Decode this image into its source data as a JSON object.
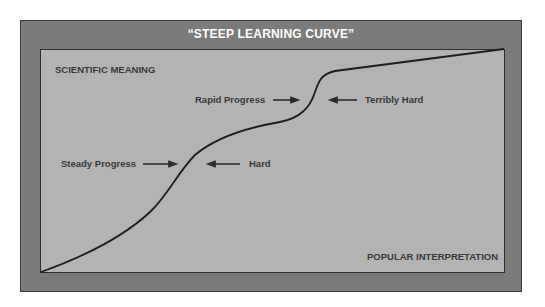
{
  "diagram": {
    "title": "“STEEP LEARNING CURVE”",
    "top_left_label": "SCIENTIFIC MEANING",
    "bottom_right_label": "POPULAR INTERPRETATION",
    "annotations": [
      {
        "text": "Steady Progress",
        "arrow": "right"
      },
      {
        "text": "Hard",
        "arrow": "left"
      },
      {
        "text": "Rapid Progress",
        "arrow": "right"
      },
      {
        "text": "Terribly Hard",
        "arrow": "left"
      }
    ],
    "colors": {
      "outer_frame": "#7b7b7b",
      "inner_panel": "#b3b3b3",
      "curve": "#1e1e1e",
      "label_text": "#3a3a3a",
      "title_text": "#ffffff"
    },
    "curve_shape": "s-curve rising with a steep jump, then a shallow linear rise"
  }
}
